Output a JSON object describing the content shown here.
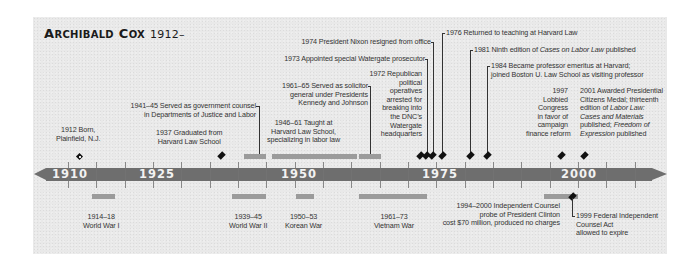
{
  "title": {
    "name_first_cap": "A",
    "name_first_rest": "RCHIBALD",
    "name_last_cap": "C",
    "name_last_rest": "OX",
    "years": "1912–"
  },
  "axis": {
    "labels": [
      "1910",
      "1925",
      "1950",
      "1975",
      "2000"
    ],
    "start_year": 1910,
    "px_per_year": 5.67
  },
  "events_above": [
    {
      "year": "1912",
      "text": [
        "1912 Born,",
        "Plainfield, N.J."
      ]
    },
    {
      "year": "1937",
      "text": [
        "1937 Graduated from",
        "Harvard Law School"
      ]
    },
    {
      "year": "1941–45",
      "text": [
        "1941–45 Served as government counsel",
        "in Departments of Justice and Labor"
      ]
    },
    {
      "year": "1946–61",
      "text": [
        "1946–61 Taught at",
        "Harvard Law School,",
        "specializing in labor law"
      ]
    },
    {
      "year": "1961–65",
      "text": [
        "1961–65 Served as solicitor",
        "general under Presidents",
        "Kennedy and Johnson"
      ]
    },
    {
      "year": "1972",
      "text": [
        "1972 Republican",
        "political",
        "operatives",
        "arrested for",
        "breaking into",
        "the DNC’s",
        "Watergate",
        "headquarters"
      ]
    },
    {
      "year": "1973",
      "text": [
        "1973 Appointed special Watergate prosecutor"
      ]
    },
    {
      "year": "1974",
      "text": [
        "1974 President Nixon resigned from office"
      ]
    },
    {
      "year": "1976",
      "text": [
        "1976 Returned to teaching at Harvard Law"
      ]
    },
    {
      "year": "1981",
      "text_pre": "1981 Ninth edition of ",
      "text_italic": "Cases on Labor Law",
      "text_post": " published"
    },
    {
      "year": "1984",
      "text": [
        "1984 Became professor emeritus at Harvard;",
        "joined Boston U. Law School as visiting professor"
      ]
    },
    {
      "year": "1997",
      "text": [
        "1997",
        "Lobbied",
        "Congress",
        "in favor of",
        "campaign",
        "finance reform"
      ]
    },
    {
      "year": "2001",
      "lines": {
        "l1": "2001 Awarded Presidential",
        "l2": "Citizens Medal; thirteenth",
        "l3_pre": "edition of ",
        "l3_italic": "Labor Law:",
        "l4_italic": "Cases and Materials",
        "l5_pre": "published; ",
        "l5_italic": "Freedom of",
        "l6_italic": "Expression",
        "l6_post": " published"
      }
    }
  ],
  "events_below": [
    {
      "years": "1914–18",
      "text": [
        "1914–18",
        "World War I"
      ]
    },
    {
      "years": "1939–45",
      "text": [
        "1939–45",
        "World War II"
      ]
    },
    {
      "years": "1950–53",
      "text": [
        "1950–53",
        "Korean War"
      ]
    },
    {
      "years": "1961–73",
      "text": [
        "1961–73",
        "Vietnam War"
      ]
    },
    {
      "years": "1994–2000",
      "text": [
        "1994–2000 Independent Counsel",
        "probe of President Clinton",
        "cost $70 million, produced no charges"
      ]
    },
    {
      "year": "1999",
      "text": [
        "1999 Federal Independent",
        "Counsel Act",
        "allowed to expire"
      ]
    }
  ],
  "colors": {
    "band": "#6e6e6e",
    "period_bar": "#9b9b9b",
    "marker": "#111111",
    "panel_bg": "#e9e9e9"
  }
}
